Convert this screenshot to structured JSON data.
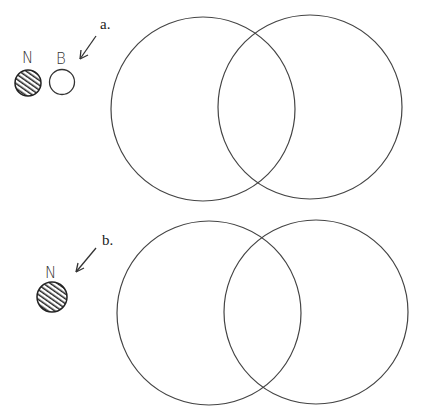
{
  "panels": [
    {
      "label": "a.",
      "particles": [
        {
          "letter": "N",
          "style": "hatched"
        },
        {
          "letter": "B",
          "style": "open"
        }
      ],
      "venn": {
        "circles": 2
      }
    },
    {
      "label": "b.",
      "particles": [
        {
          "letter": "N",
          "style": "hatched"
        }
      ],
      "venn": {
        "circles": 2
      }
    }
  ]
}
